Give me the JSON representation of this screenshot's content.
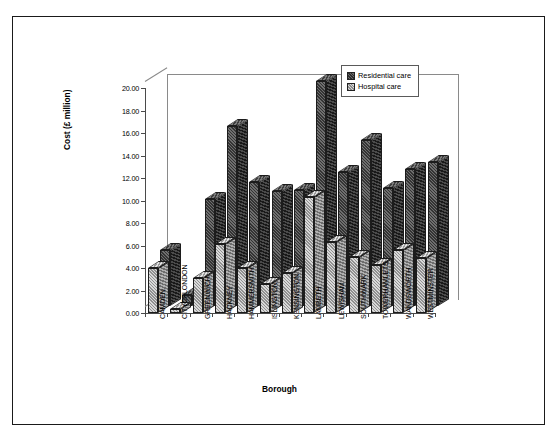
{
  "figure": {
    "background": "#ffffff",
    "frame_color": "#1a1a1a"
  },
  "chart_data": {
    "type": "bar",
    "title": "",
    "xlabel": "Borough",
    "ylabel": "Cost (£ million)",
    "ylim": [
      0,
      20
    ],
    "ytick_step": 2,
    "grid": false,
    "legend_position": "top-right",
    "style": "3d-clustered-column",
    "ytick_labels": [
      "0.00",
      "2.00",
      "4.00",
      "6.00",
      "8.00",
      "10.00",
      "12.00",
      "14.00",
      "16.00",
      "18.00",
      "20.00"
    ],
    "categories": [
      "CAMDEN",
      "CITYOFLONDON",
      "GREENWICH",
      "HACKNEY",
      "HAMMERSMITH",
      "ISLINGTON",
      "KENSINGTON",
      "LAMBETH",
      "LEWISHAM",
      "SOUTHWARK",
      "TOWERHAMLETS",
      "WANDSWORTH",
      "WESTMINSTER"
    ],
    "series": [
      {
        "name": "Residential care",
        "color": "#3a3a3a",
        "values": [
          5.0,
          1.0,
          9.5,
          16.0,
          11.0,
          10.2,
          10.3,
          20.0,
          11.9,
          14.8,
          10.5,
          12.2,
          12.8
        ]
      },
      {
        "name": "Hospital care",
        "color": "#b8b8b8",
        "values": [
          4.0,
          0.4,
          3.1,
          6.1,
          4.0,
          2.6,
          3.6,
          10.3,
          6.3,
          5.0,
          4.3,
          5.6,
          4.9
        ]
      }
    ]
  },
  "legend": {
    "entries": [
      {
        "label": "Residential care",
        "swatch": "residential-swatch"
      },
      {
        "label": "Hospital care",
        "swatch": "hospital-swatch"
      }
    ]
  }
}
